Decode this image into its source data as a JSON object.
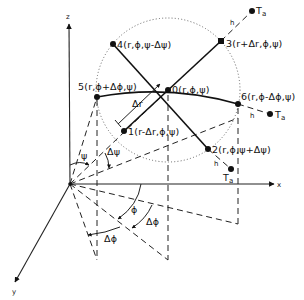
{
  "figure": {
    "type": "3D spherical-coordinate stencil diagram",
    "axes": {
      "z_label": "z",
      "x_label": "x",
      "y_label": "y"
    },
    "points": [
      {
        "id": "0",
        "label": "0(r,ϕ,ψ)"
      },
      {
        "id": "1",
        "label": "1(r-Δr,ϕ,ψ)"
      },
      {
        "id": "2",
        "label": "2(r,ϕ,ψ+Δψ)"
      },
      {
        "id": "3",
        "label": "3(r+Δr,ϕ,ψ)"
      },
      {
        "id": "4",
        "label": "4(r,ϕ,ψ-Δψ)"
      },
      {
        "id": "5",
        "label": "5(r,ϕ+Δϕ,ψ)"
      },
      {
        "id": "6",
        "label": "6(r,ϕ-Δϕ,ψ)"
      }
    ],
    "ambient_points": [
      {
        "id": "Ta_top",
        "label": "T",
        "sub": "a",
        "h_label": "h"
      },
      {
        "id": "Ta_right",
        "label": "T",
        "sub": "a",
        "h_label": "h"
      },
      {
        "id": "Ta_bottom",
        "label": "T",
        "sub": "a",
        "h_label": "h"
      }
    ],
    "annotations": {
      "delta_r": "Δr",
      "psi": "ψ",
      "delta_psi": "Δψ",
      "phi": "ϕ",
      "delta_phi_1": "Δϕ",
      "delta_phi_2": "Δϕ"
    }
  }
}
